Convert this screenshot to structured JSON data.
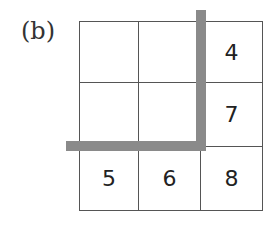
{
  "label": "(b)",
  "grid": {
    "rows": 3,
    "cols": 3,
    "cells": [
      [
        "",
        "",
        "4"
      ],
      [
        "",
        "",
        "7"
      ],
      [
        "5",
        "6",
        "8"
      ]
    ]
  },
  "bars": {
    "color": "#8a8a8a",
    "description": "Thick L-shaped divider separating top-left 2x2 block from the right column and bottom row"
  }
}
